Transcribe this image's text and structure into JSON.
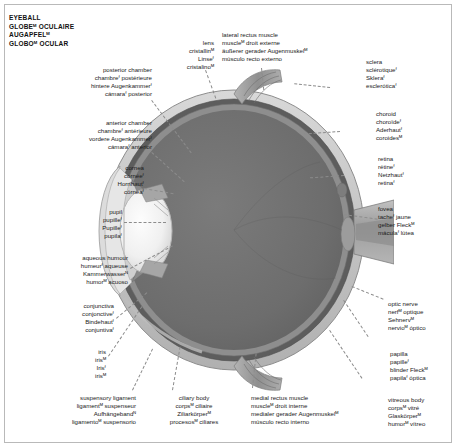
{
  "title": {
    "lines": [
      {
        "text": "EYEBALL",
        "marker": ""
      },
      {
        "text": "GLOBE",
        "marker": "M",
        "rest": " OCULAIRE"
      },
      {
        "text": "AUGAPFEL",
        "marker": "M",
        "rest": ""
      },
      {
        "text": "GLOBO",
        "marker": "M",
        "rest": " OCULAR"
      }
    ],
    "plain": [
      "EYEBALL",
      "GLOBEᴹ OCULAIRE",
      "AUGAPFELᴹ",
      "GLOBOᴹ OCULAR"
    ]
  },
  "labels": {
    "posterior_chamber": {
      "en": "posterior chamber",
      "fr": "chambreᶠ postérieure",
      "de": "hintere Augenkammerᶠ",
      "es": "cámaraᶠ posterior"
    },
    "anterior_chamber": {
      "en": "anterior chamber",
      "fr": "chambreᶠ antérieure",
      "de": "vordere Augenkammerᶠ",
      "es": "cámaraᶠ anterior"
    },
    "cornea": {
      "en": "cornea",
      "fr": "cornéeᶠ",
      "de": "Hornhautᶠ",
      "es": "córneaᶠ"
    },
    "pupil": {
      "en": "pupil",
      "fr": "pupilleᶠ",
      "de": "Pupilleᶠ",
      "es": "pupilaᶠ"
    },
    "aqueous_humour": {
      "en": "aqueous humour",
      "fr": "humeurᶠ aqueuse",
      "de": "Kammerwasserᴺ",
      "es": "humorᴹ acuoso"
    },
    "conjunctiva": {
      "en": "conjunctiva",
      "fr": "conjonctiveᶠ",
      "de": "Bindehautᶠ",
      "es": "conjuntivaᶠ"
    },
    "iris": {
      "en": "iris",
      "fr": "irisᴹ",
      "de": "Irisᶠ",
      "es": "irisᴹ"
    },
    "suspensory_ligament": {
      "en": "suspensory ligament",
      "fr": "ligamentᴹ suspenseur",
      "de": "Aufhängebandᴺ",
      "es": "ligamentoᴹ suspensorio"
    },
    "ciliary_body": {
      "en": "ciliary body",
      "fr": "corpsᴹ ciliaire",
      "de": "Ziliarkörperᴹ",
      "es": "procesosᴹ ciliares"
    },
    "medial_rectus_muscle": {
      "en": "medial rectus muscle",
      "fr": "muscleᴹ droit interne",
      "de": "medialer gerader Augenmuskelᴹ",
      "es": "músculo recto interno"
    },
    "lens": {
      "en": "lens",
      "fr": "cristallinᴹ",
      "de": "Linseᶠ",
      "es": "cristalinoᴹ"
    },
    "lateral_rectus_muscle": {
      "en": "lateral rectus muscle",
      "fr": "muscleᴹ droit externe",
      "de": "äußerer gerader Augenmuskelᴹ",
      "es": "músculo recto externo"
    },
    "sclera": {
      "en": "sclera",
      "fr": "sclérotiqueᶠ",
      "de": "Skleraᶠ",
      "es": "escleróticaᶠ"
    },
    "choroid": {
      "en": "choroid",
      "fr": "choroïdeᶠ",
      "de": "Aderhautᶠ",
      "es": "coroidesᴹ"
    },
    "retina": {
      "en": "retina",
      "fr": "rétineᶠ",
      "de": "Netzhautᶠ",
      "es": "retinaᶠ"
    },
    "fovea": {
      "en": "fovea",
      "fr": "tacheᶠ jaune",
      "de": "gelber Fleckᴹ",
      "es": "máculaᶠ lútea"
    },
    "optic_nerve": {
      "en": "optic nerve",
      "fr": "nerfᴹ optique",
      "de": "Sehnervᴹ",
      "es": "nervioᴹ óptico"
    },
    "papilla": {
      "en": "papilla",
      "fr": "papilleᶠ",
      "de": "blinder Fleckᴹ",
      "es": "papilaᶠ óptica"
    },
    "vitreous_body": {
      "en": "vitreous body",
      "fr": "corpsᴹ vitré",
      "de": "Glaskörperᴹ",
      "es": "humorᴹ vítreo"
    }
  },
  "colors": {
    "vitreous": "#6f6f6f",
    "retina": "#8e8e8e",
    "choroid": "#5d5d5d",
    "sclera": "#c9c9c9",
    "outer": "#a8a8a8",
    "lens": "#ededed",
    "cornea": "#dcdcdc",
    "muscle": "#9b9b9b",
    "leader": "#8c8c8c",
    "text": "#1a1a1a",
    "frame": "#b9b9b9"
  }
}
